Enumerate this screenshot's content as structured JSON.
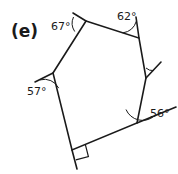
{
  "figure": {
    "part_label": "(e)",
    "shape_name": "pentagon-with-exterior-angles",
    "stroke_color": "#1a1a1a",
    "background_color": "#ffffff",
    "angle_labels": [
      {
        "id": "angle-67",
        "text": "67°",
        "value": 67,
        "unit": "degrees",
        "x": 51,
        "y": 21
      },
      {
        "id": "angle-62",
        "text": "62°",
        "value": 62,
        "unit": "degrees",
        "x": 117,
        "y": 11
      },
      {
        "id": "angle-57",
        "text": "57°",
        "value": 57,
        "unit": "degrees",
        "x": 27,
        "y": 86
      },
      {
        "id": "angle-56",
        "text": "56°",
        "value": 56,
        "unit": "degrees",
        "x": 150,
        "y": 108
      }
    ],
    "right_angle": {
      "id": "right-angle-mark",
      "value": 90,
      "unit": "degrees",
      "marker": "square",
      "vertex_x": 72,
      "vertex_y": 150
    },
    "vertices": [
      {
        "name": "vertex-top-left",
        "x": 86,
        "y": 21
      },
      {
        "name": "vertex-top-right",
        "x": 139,
        "y": 38
      },
      {
        "name": "vertex-right",
        "x": 146,
        "y": 78
      },
      {
        "name": "vertex-bottom-right",
        "x": 137,
        "y": 123
      },
      {
        "name": "vertex-bottom-left",
        "x": 72,
        "y": 150
      },
      {
        "name": "vertex-left",
        "x": 53,
        "y": 73
      }
    ]
  }
}
